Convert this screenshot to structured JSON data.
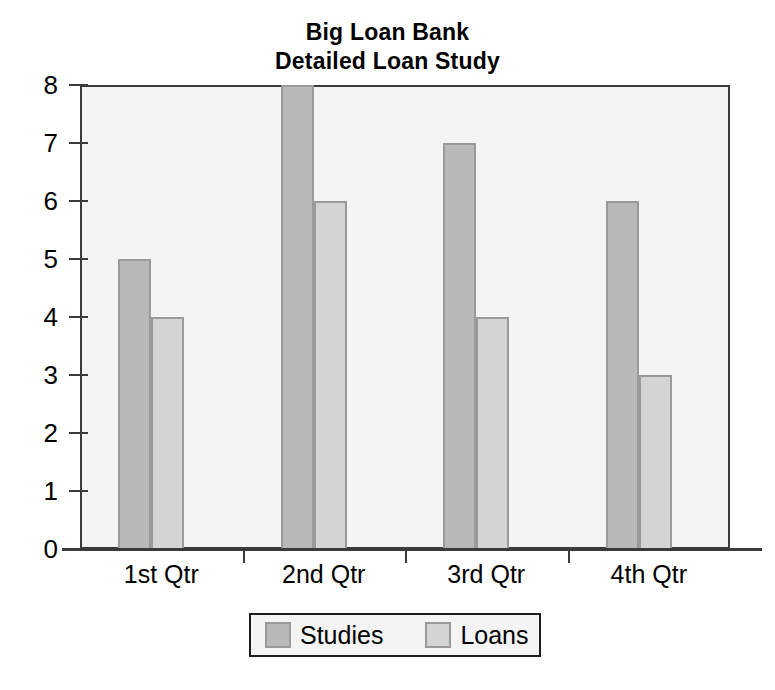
{
  "chart_data": {
    "type": "bar",
    "title": "Big Loan Bank Detailed Loan Study",
    "title_lines": [
      "Big Loan Bank",
      "Detailed Loan Study"
    ],
    "xlabel": "",
    "ylabel": "",
    "categories": [
      "1st Qtr",
      "2nd Qtr",
      "3rd Qtr",
      "4th Qtr"
    ],
    "series": [
      {
        "name": "Studies",
        "values": [
          5,
          8,
          7,
          6
        ],
        "color": "#b9b9b9"
      },
      {
        "name": "Loans",
        "values": [
          4,
          6,
          4,
          3
        ],
        "color": "#d4d4d4"
      }
    ],
    "ylim": [
      0,
      8
    ],
    "y_ticks": [
      0,
      1,
      2,
      3,
      4,
      5,
      6,
      7,
      8
    ],
    "y_tick_labels": [
      "0",
      "1",
      "2",
      "3",
      "4",
      "5",
      "6",
      "7",
      "8"
    ],
    "grid": false,
    "legend_position": "bottom",
    "plot_background": "#f4f4f4",
    "axis_color": "#3b3b3b",
    "bar_border_color": "#9a9a9a"
  }
}
